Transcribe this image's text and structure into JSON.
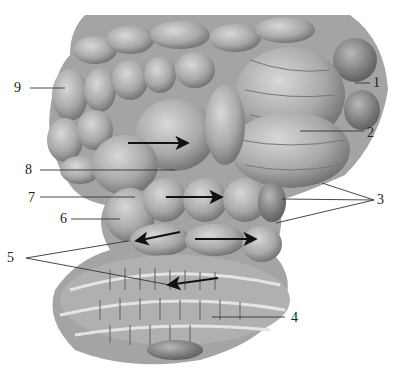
{
  "figure": {
    "colors": {
      "background": "#ffffff",
      "specimen_light": "#c8c8c8",
      "specimen_mid": "#a4a4a4",
      "specimen_dark": "#6a6a6a",
      "line": "#333333",
      "arrow": "#111111",
      "text": "#222222"
    }
  },
  "labels": [
    {
      "id": "1",
      "text": "1",
      "x": 373,
      "y": 76
    },
    {
      "id": "2",
      "text": "2",
      "x": 367,
      "y": 126
    },
    {
      "id": "3",
      "text": "3",
      "x": 377,
      "y": 193
    },
    {
      "id": "4",
      "text": "4",
      "x": 291,
      "y": 311
    },
    {
      "id": "5",
      "text": "5",
      "x": 7,
      "y": 251
    },
    {
      "id": "6",
      "text": "6",
      "x": 60,
      "y": 212
    },
    {
      "id": "7",
      "text": "7",
      "x": 28,
      "y": 191
    },
    {
      "id": "8",
      "text": "8",
      "x": 25,
      "y": 163
    },
    {
      "id": "9",
      "text": "9",
      "x": 14,
      "y": 81
    }
  ],
  "leaders": [
    {
      "label": "1",
      "x1": 355,
      "y1": 83,
      "x2": 370,
      "y2": 83
    },
    {
      "label": "2",
      "x1": 300,
      "y1": 131,
      "x2": 364,
      "y2": 131
    },
    {
      "label": "3",
      "x1": 322,
      "y1": 183,
      "x2": 374,
      "y2": 200
    },
    {
      "label": "3",
      "x1": 282,
      "y1": 199,
      "x2": 374,
      "y2": 200
    },
    {
      "label": "3",
      "x1": 276,
      "y1": 223,
      "x2": 374,
      "y2": 200
    },
    {
      "label": "4",
      "x1": 212,
      "y1": 317,
      "x2": 285,
      "y2": 317
    },
    {
      "label": "5",
      "x1": 26,
      "y1": 258,
      "x2": 128,
      "y2": 241
    },
    {
      "label": "5",
      "x1": 26,
      "y1": 258,
      "x2": 170,
      "y2": 285
    },
    {
      "label": "6",
      "x1": 71,
      "y1": 219,
      "x2": 120,
      "y2": 219
    },
    {
      "label": "7",
      "x1": 40,
      "y1": 197,
      "x2": 135,
      "y2": 197
    },
    {
      "label": "8",
      "x1": 40,
      "y1": 170,
      "x2": 175,
      "y2": 170
    },
    {
      "label": "9",
      "x1": 30,
      "y1": 88,
      "x2": 65,
      "y2": 88
    }
  ],
  "arrows": [
    {
      "x1": 128,
      "y1": 143,
      "x2": 188,
      "y2": 143
    },
    {
      "x1": 166,
      "y1": 197,
      "x2": 222,
      "y2": 197
    },
    {
      "x1": 180,
      "y1": 232,
      "x2": 136,
      "y2": 241
    },
    {
      "x1": 195,
      "y1": 239,
      "x2": 256,
      "y2": 239
    },
    {
      "x1": 218,
      "y1": 278,
      "x2": 168,
      "y2": 285
    }
  ]
}
